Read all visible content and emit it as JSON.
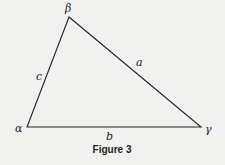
{
  "figure": {
    "caption": "Figure 3",
    "shape": "triangle",
    "vertices": {
      "alpha": "α",
      "beta": "β",
      "gamma": "γ"
    },
    "sides": {
      "a": "a",
      "b": "b",
      "c": "c"
    },
    "colors": {
      "background": "#f1f1ef",
      "stroke": "#222222"
    }
  }
}
